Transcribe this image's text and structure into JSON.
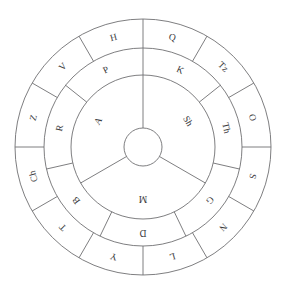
{
  "figure": {
    "background_color": "#ffffff",
    "stroke_color": "#6f6f72",
    "text_color": "#3a3a3c",
    "center": {
      "x": 143,
      "y": 147
    },
    "radii": {
      "outer": 128,
      "ring_outer_inner": 99,
      "ring_middle_inner": 72,
      "hub": 19
    }
  },
  "rings": [
    {
      "name": "outer-ring",
      "sector_count": 12,
      "start_angle_deg": 90,
      "letters": [
        "Q",
        "Tz",
        "O",
        "S",
        "N",
        "L",
        "Y",
        "T",
        "Ch",
        "Z",
        "V",
        "H"
      ]
    },
    {
      "name": "middle-ring",
      "sector_count": 7,
      "start_angle_deg": 90,
      "letters": [
        "K",
        "Th",
        "G",
        "D",
        "B",
        "R",
        "P"
      ]
    },
    {
      "name": "inner-ring",
      "sector_count": 3,
      "start_angle_deg": 90,
      "letters": [
        "Sh",
        "M",
        "A"
      ]
    }
  ],
  "hub": {
    "name": "center-hub",
    "label": ""
  }
}
